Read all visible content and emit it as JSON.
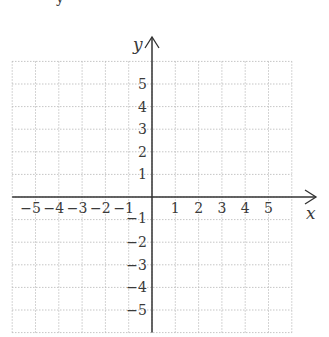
{
  "header": {
    "cut_text_fragment": "y"
  },
  "chart_data": {
    "type": "scatter",
    "title": "",
    "xlabel": "x",
    "ylabel": "y",
    "xlim": [
      -6,
      6
    ],
    "ylim": [
      -6,
      6
    ],
    "grid": true,
    "grid_style": "dotted",
    "x_ticks": [
      -5,
      -4,
      -3,
      -2,
      -1,
      1,
      2,
      3,
      4,
      5
    ],
    "y_ticks": [
      -5,
      -4,
      -3,
      -2,
      -1,
      1,
      2,
      3,
      4,
      5
    ],
    "x_tick_labels": [
      "−5",
      "−4",
      "−3",
      "−2",
      "−1",
      "1",
      "2",
      "3",
      "4",
      "5"
    ],
    "y_tick_labels": [
      "−5",
      "−4",
      "−3",
      "−2",
      "−1",
      "1",
      "2",
      "3",
      "4",
      "5"
    ],
    "series": [],
    "legend": null
  },
  "colors": {
    "axis": "#333333",
    "grid": "#b8b8b8",
    "text": "#3a3a3a"
  }
}
